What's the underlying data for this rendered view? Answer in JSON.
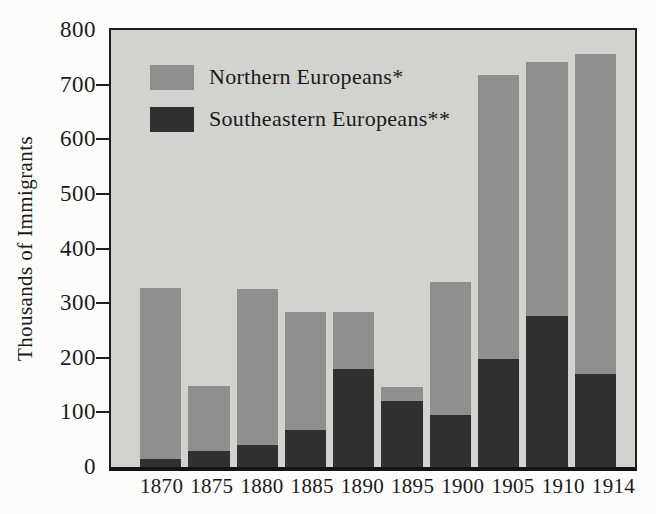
{
  "figure": {
    "background": "#fcfcfa",
    "plot_background": "#d2d2cf",
    "frame_color": "#1f1f1f",
    "text_color": "#1a1a1a"
  },
  "chart_data": {
    "type": "bar",
    "stacked": true,
    "title": "",
    "xlabel": "",
    "ylabel": "Thousands of Immigrants",
    "ylim": [
      0,
      800
    ],
    "y_ticks": [
      0,
      100,
      200,
      300,
      400,
      500,
      600,
      700,
      800
    ],
    "grid": false,
    "legend_position": "top-left-inside",
    "categories": [
      "1870",
      "1875",
      "1880",
      "1885",
      "1890",
      "1895",
      "1900",
      "1905",
      "1910",
      "1914"
    ],
    "series": [
      {
        "name": "Northern Europeans*",
        "color": "#8f8f8d",
        "values": [
          312,
          118,
          285,
          215,
          103,
          26,
          243,
          521,
          466,
          587
        ]
      },
      {
        "name": "Southeastern Europeans**",
        "color": "#303030",
        "values": [
          15,
          30,
          40,
          68,
          180,
          120,
          95,
          197,
          276,
          170
        ]
      }
    ],
    "totals": [
      327,
      148,
      325,
      283,
      283,
      146,
      338,
      718,
      742,
      757
    ]
  }
}
